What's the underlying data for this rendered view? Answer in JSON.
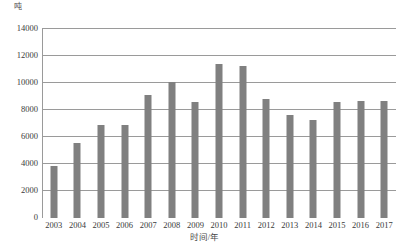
{
  "chart_data": {
    "type": "bar",
    "title": "",
    "subtitle": "",
    "xlabel": "时间/年",
    "ylabel": "吨",
    "categories": [
      "2003",
      "2004",
      "2005",
      "2006",
      "2007",
      "2008",
      "2009",
      "2010",
      "2011",
      "2012",
      "2013",
      "2014",
      "2015",
      "2016",
      "2017"
    ],
    "values": [
      3850,
      5550,
      6900,
      6900,
      9100,
      10100,
      8600,
      11400,
      11250,
      8850,
      7600,
      7250,
      8600,
      8700,
      8650
    ],
    "series": [
      {
        "name": "",
        "values": [
          3850,
          5550,
          6900,
          6900,
          9100,
          10100,
          8600,
          11400,
          11250,
          8850,
          7600,
          7250,
          8600,
          8700,
          8650
        ]
      }
    ],
    "ylim": [
      0,
      14000
    ],
    "yticks": [
      0,
      2000,
      4000,
      6000,
      8000,
      10000,
      12000,
      14000
    ],
    "ytick_labels": [
      "0",
      "2000",
      "4000",
      "6000",
      "8000",
      "10000",
      "12000",
      "14000"
    ],
    "grid": true,
    "legend": false,
    "legend_position": "none",
    "bar_color": "#808080",
    "gridline_color": "#9a9a9a",
    "background_color": "#ffffff"
  }
}
